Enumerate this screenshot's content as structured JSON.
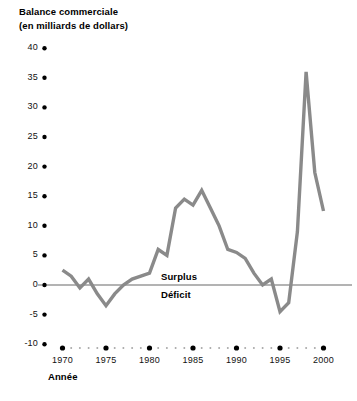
{
  "title": {
    "line1": "Balance commerciale",
    "line2": "(en milliards de dollars)"
  },
  "axis_caption": "Année",
  "zone_labels": {
    "above": "Surplus",
    "below": "Déficit"
  },
  "colors": {
    "line": "#8a8a8a",
    "zero_line": "#b3b3b3",
    "text": "#000000",
    "tick_dot": "#000000",
    "minor_dot": "#a8a8a8",
    "background": "#ffffff"
  },
  "chart_data": {
    "type": "line",
    "title": "Balance commerciale (en milliards de dollars)",
    "xlabel": "Année",
    "ylabel": "Balance commerciale (en milliards de dollars)",
    "xlim": [
      1969,
      2000
    ],
    "ylim": [
      -10,
      40
    ],
    "ytick_labels": [
      "40",
      "35",
      "30",
      "25",
      "20",
      "15",
      "10",
      "5",
      "0",
      "-5",
      "-10"
    ],
    "yticks": [
      40,
      35,
      30,
      25,
      20,
      15,
      10,
      5,
      0,
      -5,
      -10
    ],
    "xtick_labels": [
      "1970",
      "1975",
      "1980",
      "1985",
      "1990",
      "1995",
      "2000"
    ],
    "xticks": [
      1970,
      1975,
      1980,
      1985,
      1990,
      1995,
      2000
    ],
    "minor_xticks": [
      1971,
      1972,
      1973,
      1974,
      1976,
      1977,
      1978,
      1979,
      1981,
      1982,
      1983,
      1984,
      1986,
      1987,
      1988,
      1989,
      1991,
      1992,
      1993,
      1994,
      1996,
      1997,
      1998,
      1999
    ],
    "grid": false,
    "legend": "none",
    "reference_line": 0,
    "annotations": [
      {
        "text": "Surplus",
        "value_side": "above-zero"
      },
      {
        "text": "Déficit",
        "value_side": "below-zero"
      }
    ],
    "x": [
      1970,
      1971,
      1972,
      1973,
      1974,
      1975,
      1976,
      1977,
      1978,
      1979,
      1980,
      1981,
      1982,
      1983,
      1984,
      1985,
      1986,
      1987,
      1988,
      1989,
      1990,
      1991,
      1992,
      1993,
      1994,
      1995,
      1996,
      1997,
      1998,
      1999,
      2000
    ],
    "values": [
      2.5,
      1.5,
      -0.5,
      1.0,
      -1.5,
      -3.5,
      -1.5,
      0.0,
      1.0,
      1.5,
      2.0,
      6.0,
      5.0,
      13.0,
      14.5,
      13.5,
      16.0,
      13.0,
      10.0,
      6.0,
      5.5,
      4.5,
      2.0,
      0.0,
      1.0,
      -4.5,
      -3.0,
      9.0,
      36.0,
      19.0,
      12.5
    ],
    "series": [
      {
        "name": "Balance commerciale",
        "values": [
          2.5,
          1.5,
          -0.5,
          1.0,
          -1.5,
          -3.5,
          -1.5,
          0.0,
          1.0,
          1.5,
          2.0,
          6.0,
          5.0,
          13.0,
          14.5,
          13.5,
          16.0,
          13.0,
          10.0,
          6.0,
          5.5,
          4.5,
          2.0,
          0.0,
          1.0,
          -4.5,
          -3.0,
          9.0,
          36.0,
          19.0,
          12.5
        ]
      }
    ]
  }
}
